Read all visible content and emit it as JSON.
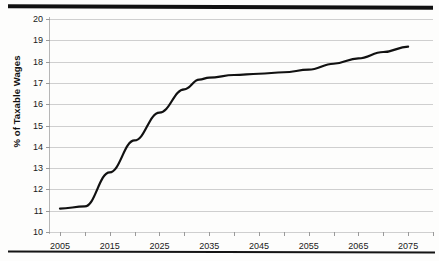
{
  "chart_data": {
    "type": "line",
    "title": "",
    "xlabel": "",
    "ylabel": "% of Taxable Wages",
    "xlim": [
      2003,
      2080
    ],
    "ylim": [
      10,
      20
    ],
    "grid": true,
    "legend": "none",
    "y_ticks": [
      20,
      19,
      18,
      17,
      16,
      15,
      14,
      13,
      12,
      11,
      10
    ],
    "x_ticks": [
      2005,
      2015,
      2025,
      2035,
      2045,
      2055,
      2065,
      2075
    ],
    "x_minor_ticks": [
      2005,
      2010,
      2015,
      2020,
      2025,
      2030,
      2035,
      2040,
      2045,
      2050,
      2055,
      2060,
      2065,
      2070,
      2075,
      2080
    ],
    "series": [
      {
        "name": "Cost as % of Taxable Wages",
        "color": "#111111",
        "x": [
          2005,
          2010,
          2015,
          2020,
          2025,
          2030,
          2033,
          2035,
          2040,
          2045,
          2050,
          2055,
          2060,
          2065,
          2070,
          2075
        ],
        "values": [
          11.1,
          11.2,
          12.8,
          14.3,
          15.6,
          16.7,
          17.15,
          17.25,
          17.37,
          17.43,
          17.5,
          17.62,
          17.9,
          18.15,
          18.45,
          18.7
        ]
      }
    ],
    "decorations": {
      "top_rule": "thick-black-horizontal-rule",
      "bottom_rule": "thin-black-horizontal-rule"
    }
  }
}
